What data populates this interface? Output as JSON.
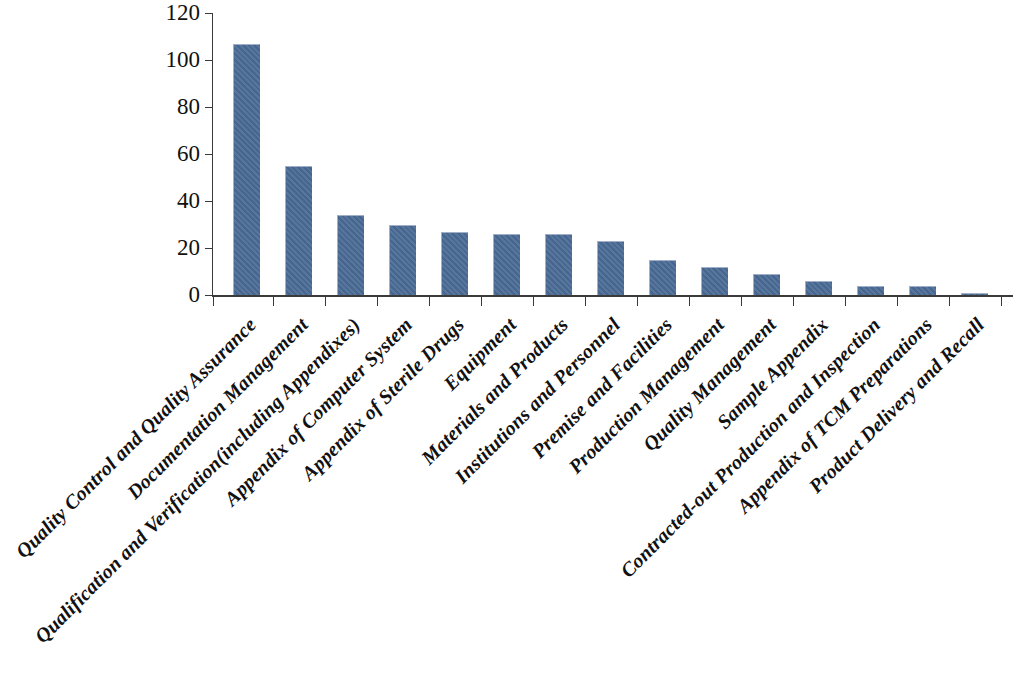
{
  "chart_data": {
    "type": "bar",
    "title": "",
    "subtitle": "",
    "xlabel": "",
    "ylabel": "",
    "ylim": [
      0,
      120
    ],
    "ytick_interval": 20,
    "yticks": [
      0,
      20,
      40,
      60,
      80,
      100,
      120
    ],
    "grid": false,
    "legend": null,
    "bar_color": "#4a6b96",
    "axis_color": "#3a3a3a",
    "background_color": "#ffffff",
    "label_rotation_deg": -45,
    "categories": [
      "Quality Control and Quality Assurance",
      "Documentation Management",
      "Qualification and Verification(including Appendixes)",
      "Appendix of Computer System",
      "Appendix of Sterile Drugs",
      "Equipment",
      "Materials and Products",
      "Institutions and Personnel",
      "Premise and Facilities",
      "Production Management",
      "Quality Management",
      "Sample Appendix",
      "Contracted-out Production and Inspection",
      "Appendix of TCM Preparations",
      "Product Delivery and Recall"
    ],
    "values": [
      107,
      55,
      34,
      30,
      27,
      26,
      26,
      23,
      15,
      12,
      9,
      6,
      4,
      4,
      1
    ]
  }
}
